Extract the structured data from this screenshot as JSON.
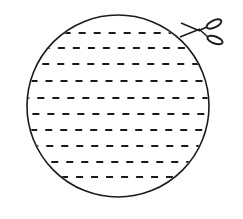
{
  "figure": {
    "stroke_color": "#1a1a1a",
    "background": "#ffffff",
    "circle": {
      "cx": 118,
      "cy": 106,
      "r": 91
    },
    "dashed_lines_y": [
      33,
      48,
      64,
      81,
      98,
      114,
      130,
      146,
      162,
      177
    ],
    "scissors": {
      "label": "scissors-icon",
      "position": "top-right"
    }
  }
}
